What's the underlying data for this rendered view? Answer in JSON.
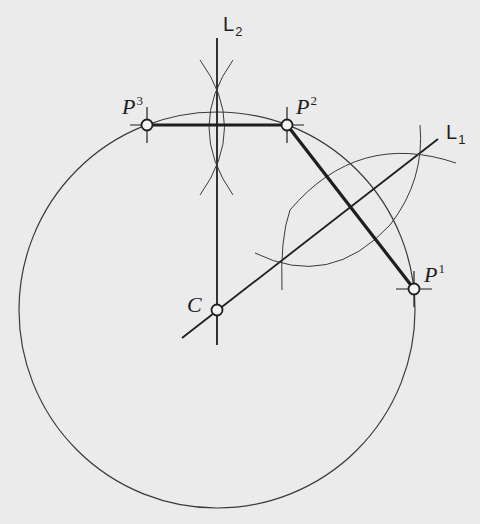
{
  "figure": {
    "colors": {
      "background": "#ebebeb",
      "ink": "#1e1e1e",
      "thin_ink": "#3a3a3a"
    },
    "points": [
      {
        "id": "P1",
        "label": "P",
        "superscript": "1",
        "x": 414,
        "y": 289
      },
      {
        "id": "P2",
        "label": "P",
        "superscript": "2",
        "x": 287,
        "y": 125
      },
      {
        "id": "P3",
        "label": "P",
        "superscript": "3",
        "x": 147,
        "y": 125
      },
      {
        "id": "C",
        "label": "C",
        "x": 217,
        "y": 310
      }
    ],
    "lines": [
      {
        "id": "L1",
        "label": "L",
        "subscript": "1",
        "description": "perpendicular bisector of P1-P2"
      },
      {
        "id": "L2",
        "label": "L",
        "subscript": "2",
        "description": "perpendicular bisector of P2-P3"
      }
    ],
    "chords": [
      {
        "from": "P3",
        "to": "P2",
        "style": "bold"
      },
      {
        "from": "P2",
        "to": "P1",
        "style": "bold"
      }
    ],
    "circle": {
      "center": "C",
      "cx": 217,
      "cy": 310,
      "r": 198
    }
  }
}
